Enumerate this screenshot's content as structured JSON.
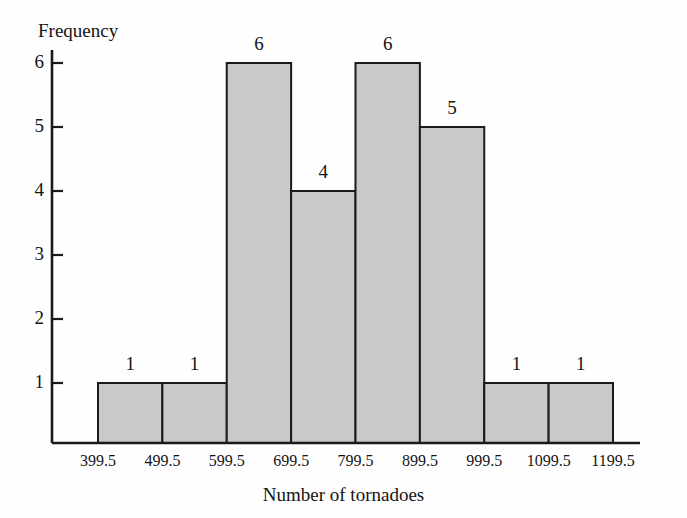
{
  "chart_data": {
    "type": "bar",
    "title": "",
    "subtitle": "",
    "xlabel": "Number of tornadoes",
    "ylabel": "Frequency",
    "categories": [
      "399.5-499.5",
      "499.5-599.5",
      "599.5-699.5",
      "699.5-799.5",
      "799.5-899.5",
      "899.5-999.5",
      "999.5-1099.5",
      "1099.5-1199.5"
    ],
    "values": [
      1,
      1,
      6,
      4,
      6,
      5,
      1,
      1
    ],
    "bin_edges": [
      399.5,
      499.5,
      599.5,
      699.5,
      799.5,
      899.5,
      999.5,
      1099.5,
      1199.5
    ],
    "bin_edge_labels": [
      "399.5",
      "499.5",
      "599.5",
      "699.5",
      "799.5",
      "899.5",
      "999.5",
      "1099.5",
      "1199.5"
    ],
    "data_labels": [
      "1",
      "1",
      "6",
      "4",
      "6",
      "5",
      "1",
      "1"
    ],
    "ylim": [
      0,
      6
    ],
    "ytick_values": [
      1,
      2,
      3,
      4,
      5,
      6
    ],
    "ytick_labels": [
      "1",
      "2",
      "3",
      "4",
      "5",
      "6"
    ],
    "grid": false,
    "legend": null,
    "legend_position": "none",
    "bar_fill_color": "#c9c9c9",
    "bar_edge_color": "#1a1a1a",
    "axis_color": "#1a1a1a",
    "background_color": "#fefefe",
    "annotations": []
  },
  "labels": {
    "y_axis_title": "Frequency",
    "x_axis_title": "Number of tornadoes"
  }
}
